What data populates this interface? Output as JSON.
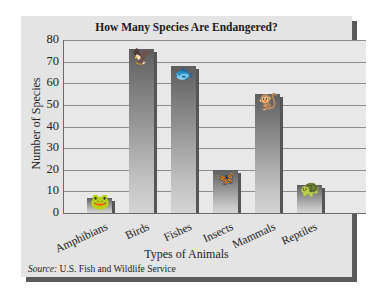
{
  "chart_data": {
    "type": "bar",
    "title": "How Many Species Are Endangered?",
    "xlabel": "Types of Animals",
    "ylabel": "Number of Species",
    "categories": [
      "Amphibians",
      "Birds",
      "Fishes",
      "Insects",
      "Mammals",
      "Reptiles"
    ],
    "values": [
      7,
      76,
      68,
      20,
      55,
      13
    ],
    "ylim": [
      0,
      80
    ],
    "yticks": [
      0,
      10,
      20,
      30,
      40,
      50,
      60,
      70,
      80
    ],
    "grid": true,
    "legend": null,
    "source_label": "Source:",
    "source_text": " U.S. Fish and Wildlife Service",
    "bar_icons": [
      "frog-icon",
      "bird-icon",
      "fish-icon",
      "butterfly-icon",
      "lemur-icon",
      "turtle-icon"
    ]
  },
  "colors": {
    "panel": "#e4e4e4",
    "plot": "#e8e8e8",
    "bar_top": "#5e5e5e",
    "bar_bottom": "#d4d4d4",
    "shadow": "#5a5a5a"
  }
}
